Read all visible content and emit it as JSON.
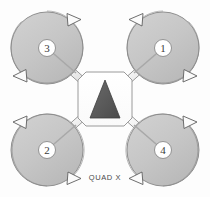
{
  "diagram": {
    "title": "QUAD X",
    "caption": "QUAD X",
    "frame_type": "quad-x",
    "background_color": "#fdfdfd",
    "body": {
      "shape": "rounded-octagon",
      "fill": "#ffffff",
      "stroke": "#9a9a9a",
      "heading_indicator": {
        "name": "forward-direction-triangle",
        "shape": "triangle",
        "points_toward": "up",
        "fill": "#565656",
        "stroke": "#3d3d3d"
      }
    },
    "arm": {
      "fill": "#f4f4f4",
      "stroke": "#8d8d8d"
    },
    "rotor_defaults": {
      "disc_fill": "#c6c6c6",
      "disc_stroke": "#8f8f8f",
      "hub_fill": "#ffffff",
      "hub_stroke": "#8a8a8a",
      "arrow_fill": "#fbfbfb",
      "arrow_stroke": "#5f5f5f",
      "radius": 36
    },
    "rotors": [
      {
        "id": "rotor-1",
        "label": "1",
        "position": "top-right",
        "cx": 163,
        "cy": 48,
        "spin": "counter-clockwise",
        "spin_label": "CCW"
      },
      {
        "id": "rotor-2",
        "label": "2",
        "position": "bottom-left",
        "cx": 47,
        "cy": 150,
        "spin": "counter-clockwise",
        "spin_label": "CCW"
      },
      {
        "id": "rotor-3",
        "label": "3",
        "position": "top-left",
        "cx": 47,
        "cy": 48,
        "spin": "clockwise",
        "spin_label": "CW"
      },
      {
        "id": "rotor-4",
        "label": "4",
        "position": "bottom-right",
        "cx": 163,
        "cy": 150,
        "spin": "clockwise",
        "spin_label": "CW"
      }
    ]
  }
}
